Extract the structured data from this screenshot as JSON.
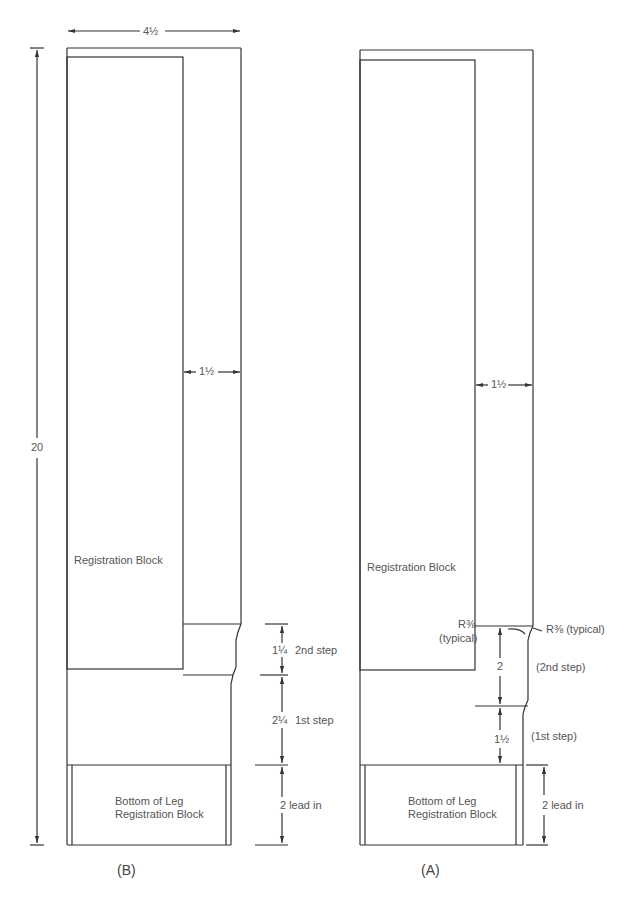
{
  "figure": {
    "colors": {
      "line": "#333333",
      "text": "#555555",
      "background": "#ffffff"
    }
  },
  "drawing_b": {
    "caption": "(B)",
    "overall_width": "4½",
    "overall_height": "20",
    "offset_dim": "1½",
    "block_label": "Registration Block",
    "bottom_block_label_line1": "Bottom of Leg",
    "bottom_block_label_line2": "Registration Block",
    "steps": [
      {
        "value": "1¼",
        "label": "2nd step"
      },
      {
        "value": "2¼",
        "label": "1st step"
      }
    ],
    "lead_in": "2 lead in"
  },
  "drawing_a": {
    "caption": "(A)",
    "offset_dim": "1½",
    "block_label": "Registration Block",
    "radius_left_line1": "R⅜",
    "radius_left_line2": "(typical)",
    "radius_right": "R⅜ (typical)",
    "steps": [
      {
        "value": "2",
        "label": "(2nd step)"
      },
      {
        "value": "1½",
        "label": "(1st step)"
      }
    ],
    "bottom_block_label_line1": "Bottom of Leg",
    "bottom_block_label_line2": "Registration Block",
    "lead_in": "2 lead in"
  }
}
